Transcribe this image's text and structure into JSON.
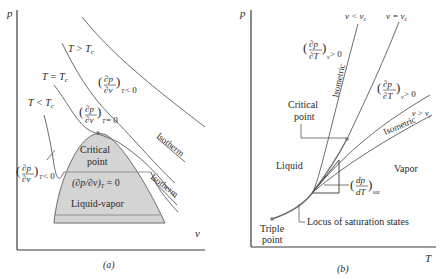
{
  "panel_a": {
    "caption": "(a)",
    "y_axis_label": "p",
    "x_axis_label": "v",
    "isotherm_labels": {
      "t_greater": "T > T",
      "t_greater_sub": "c",
      "t_equal": "T = T",
      "t_equal_sub": "c",
      "t_less": "T < T",
      "t_less_sub": "c"
    },
    "derivatives": {
      "neg_upper": {
        "num": "∂p",
        "den": "∂v",
        "sub": "T",
        "rel": "< 0"
      },
      "zero": {
        "num": "∂p",
        "den": "∂v",
        "sub": "T",
        "rel": "= 0"
      },
      "neg_left": {
        "num": "∂p",
        "den": "∂v",
        "sub": "T",
        "rel": "< 0"
      }
    },
    "dome_labels": {
      "critical_line1": "Critical",
      "critical_line2": "point",
      "inline_derivative": "(∂p/∂v)",
      "inline_sub": "T",
      "inline_rel": " = 0",
      "region": "Liquid-vapor"
    },
    "isotherm_tag_upper": "Isotherm",
    "isotherm_tag_lower": "Isotherm",
    "colors": {
      "dome_fill": "#d4d4d4",
      "dome_stroke": "#6e6e6e"
    }
  },
  "panel_b": {
    "caption": "(b)",
    "y_axis_label": "p",
    "x_axis_label": "T",
    "isometric_labels": {
      "v_less": "v < v",
      "v_less_sub": "c",
      "v_equal": "v = v",
      "v_equal_sub": "c",
      "v_greater": "v > v",
      "v_greater_sub": "c"
    },
    "derivatives": {
      "upper": {
        "num": "∂p",
        "den": "∂T",
        "sub": "v",
        "rel": "> 0"
      },
      "right": {
        "num": "∂p",
        "den": "∂T",
        "sub": "v",
        "rel": "> 0"
      },
      "sat": {
        "num": "dp",
        "den": "dT",
        "sub": "sat"
      }
    },
    "isometric_tag_upper": "Isometric",
    "isometric_tag_lower": "Isometric",
    "critical_line1": "Critical",
    "critical_line2": "point",
    "liquid": "Liquid",
    "vapor": "Vapor",
    "triple_line1": "Triple",
    "triple_line2": "point",
    "locus": "Locus of saturation states"
  }
}
